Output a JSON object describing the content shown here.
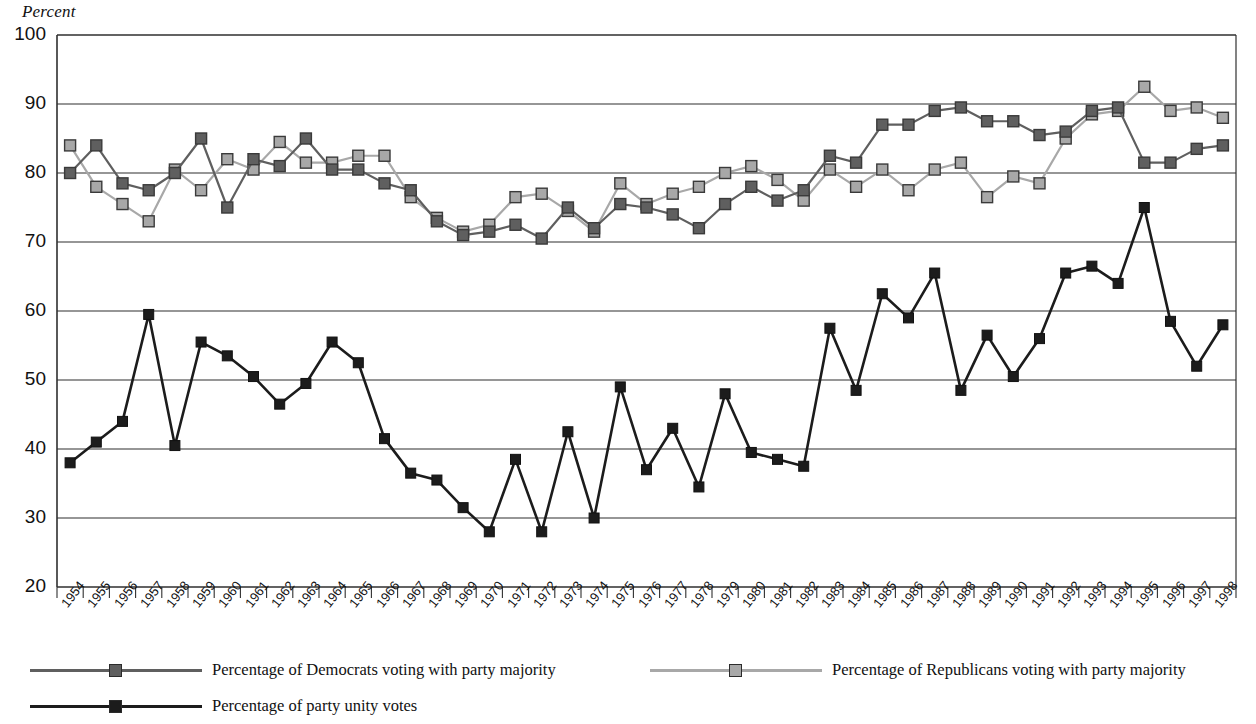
{
  "axis": {
    "unit_label": "Percent",
    "y_ticks": [
      20,
      30,
      40,
      50,
      60,
      70,
      80,
      90,
      100
    ],
    "y_min": 20,
    "y_max": 100
  },
  "legend": {
    "items": [
      {
        "key": "democrats",
        "label": "Percentage of Democrats voting with party majority",
        "color": "#5f5f5f"
      },
      {
        "key": "republicans",
        "label": "Percentage of Republicans voting with party majority",
        "color": "#a8a8a8"
      },
      {
        "key": "unity",
        "label": "Percentage of party unity votes",
        "color": "#1c1c1c"
      }
    ]
  },
  "chart_data": {
    "type": "line",
    "title": "",
    "xlabel": "",
    "ylabel": "Percent",
    "ylim": [
      20,
      100
    ],
    "grid": true,
    "legend_position": "bottom",
    "categories": [
      "1954",
      "1955",
      "1956",
      "1957",
      "1958",
      "1959",
      "1960",
      "1961",
      "1962",
      "1963",
      "1964",
      "1965",
      "1966",
      "1967",
      "1968",
      "1969",
      "1970",
      "1971",
      "1972",
      "1973",
      "1974",
      "1975",
      "1976",
      "1977",
      "1978",
      "1979",
      "1980",
      "1981",
      "1982",
      "1983",
      "1984",
      "1985",
      "1986",
      "1987",
      "1988",
      "1989",
      "1990",
      "1991",
      "1992",
      "1993",
      "1994",
      "1995",
      "1996",
      "1997",
      "1998"
    ],
    "series": [
      {
        "name": "Percentage of Democrats voting with party majority",
        "color": "#5f5f5f",
        "marker": "square-filled",
        "values": [
          80.0,
          84.0,
          78.5,
          77.5,
          80.0,
          85.0,
          75.0,
          82.0,
          81.0,
          85.0,
          80.5,
          80.5,
          78.5,
          77.5,
          73.0,
          71.0,
          71.5,
          72.5,
          70.5,
          75.0,
          72.0,
          75.5,
          75.0,
          74.0,
          72.0,
          75.5,
          78.0,
          76.0,
          77.5,
          82.5,
          81.5,
          87.0,
          87.0,
          89.0,
          89.5,
          87.5,
          87.5,
          85.5,
          86.0,
          89.0,
          89.5,
          81.5,
          81.5,
          83.5,
          84.0
        ]
      },
      {
        "name": "Percentage of Republicans voting with party majority",
        "color": "#a8a8a8",
        "marker": "square-light",
        "values": [
          84.0,
          78.0,
          75.5,
          73.0,
          80.5,
          77.5,
          82.0,
          80.5,
          84.5,
          81.5,
          81.5,
          82.5,
          82.5,
          76.5,
          73.5,
          71.5,
          72.5,
          76.5,
          77.0,
          74.5,
          71.5,
          78.5,
          75.5,
          77.0,
          78.0,
          80.0,
          81.0,
          79.0,
          76.0,
          80.5,
          78.0,
          80.5,
          77.5,
          80.5,
          81.5,
          76.5,
          79.5,
          78.5,
          85.0,
          88.5,
          89.0,
          92.5,
          89.0,
          89.5,
          88.0
        ]
      },
      {
        "name": "Percentage of party unity votes",
        "color": "#1c1c1c",
        "marker": "square-dark",
        "values": [
          38.0,
          41.0,
          44.0,
          59.5,
          40.5,
          55.5,
          53.5,
          50.5,
          46.5,
          49.5,
          55.5,
          52.5,
          41.5,
          36.5,
          35.5,
          31.5,
          28.0,
          38.5,
          28.0,
          42.5,
          30.0,
          49.0,
          37.0,
          43.0,
          34.5,
          48.0,
          39.5,
          38.5,
          37.5,
          57.5,
          48.5,
          62.5,
          59.0,
          65.5,
          48.5,
          56.5,
          50.5,
          56.0,
          65.5,
          66.5,
          64.0,
          75.0,
          58.5,
          52.0,
          58.0
        ]
      }
    ]
  }
}
